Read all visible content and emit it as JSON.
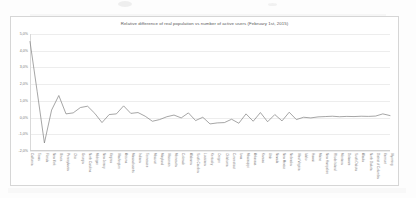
{
  "chart_data": {
    "type": "line",
    "title": "Relative difference of real population vs number of active users (February 1st, 2015)",
    "xlabel": "",
    "ylabel": "",
    "ylim": [
      -2.0,
      5.0
    ],
    "ytick_step": 1.0,
    "ytick_labels": [
      "5,0%",
      "4,0%",
      "3,0%",
      "2,0%",
      "1,0%",
      "0,0%",
      "-1,0%",
      "-2,0%"
    ],
    "ytick_values": [
      5.0,
      4.0,
      3.0,
      2.0,
      1.0,
      0.0,
      -1.0,
      -2.0
    ],
    "grid": true,
    "legend": false,
    "legend_position": "none",
    "series_color": "#808080",
    "categories": [
      "California",
      "Texas",
      "Florida",
      "New York",
      "Illinois",
      "Pennsylvania",
      "Ohio",
      "Georgia",
      "North Carolina",
      "Michigan",
      "New Jersey",
      "Virginia",
      "Washington",
      "Arizona",
      "Massachusetts",
      "Indiana",
      "Tennessee",
      "Missouri",
      "Maryland",
      "Wisconsin",
      "Minnesota",
      "Colorado",
      "Alabama",
      "South Carolina",
      "Louisiana",
      "Kentucky",
      "Oregon",
      "Oklahoma",
      "Connecticut",
      "Iowa",
      "Mississippi",
      "Arkansas",
      "Kansas",
      "Utah",
      "Nevada",
      "New Mexico",
      "Nebraska",
      "West Virginia",
      "Idaho",
      "Hawaii",
      "Maine",
      "New Hampshire",
      "Rhode Island",
      "Montana",
      "Delaware",
      "South Dakota",
      "Alaska",
      "North Dakota",
      "District of Columbia",
      "Vermont",
      "Wyoming"
    ],
    "values": [
      4.55,
      1.55,
      -1.52,
      0.45,
      1.32,
      0.22,
      0.28,
      0.6,
      0.68,
      0.25,
      -0.3,
      0.18,
      0.22,
      0.7,
      0.25,
      0.3,
      0.08,
      -0.22,
      -0.12,
      0.05,
      0.15,
      -0.02,
      0.28,
      -0.18,
      0.02,
      -0.38,
      -0.32,
      -0.3,
      -0.1,
      -0.34,
      0.22,
      -0.22,
      0.3,
      -0.25,
      0.18,
      -0.2,
      0.32,
      -0.12,
      0.02,
      -0.02,
      0.04,
      0.06,
      0.08,
      0.05,
      0.07,
      0.06,
      0.08,
      0.07,
      0.09,
      0.22,
      0.12
    ]
  }
}
